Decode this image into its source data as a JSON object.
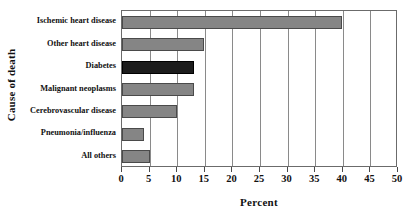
{
  "chart_data": {
    "type": "bar",
    "orientation": "horizontal",
    "title": "",
    "xlabel": "Percent",
    "ylabel": "Cause of death",
    "categories": [
      "Ischemic heart disease",
      "Other heart disease",
      "Diabetes",
      "Malignant neoplasms",
      "Cerebrovascular disease",
      "Pneumonia/influenza",
      "All others"
    ],
    "values": [
      39.8,
      14.9,
      13.0,
      13.0,
      10.0,
      4.0,
      5.0
    ],
    "bar_colors": [
      "#858585",
      "#858585",
      "#1c1c1c",
      "#858585",
      "#858585",
      "#858585",
      "#858585"
    ],
    "highlighted_category": "Diabetes",
    "xlim": [
      0,
      50
    ],
    "xticks": [
      0,
      5,
      10,
      15,
      20,
      25,
      30,
      35,
      40,
      45,
      50
    ],
    "xtick_labels": [
      "0",
      "5",
      "10",
      "15",
      "20",
      "25",
      "30",
      "35",
      "40",
      "45",
      "50"
    ],
    "grid": "vertical",
    "legend": "none",
    "accent_color": "#858585",
    "highlight_color": "#1c1c1c",
    "axis_color": "#6b6b6b"
  }
}
